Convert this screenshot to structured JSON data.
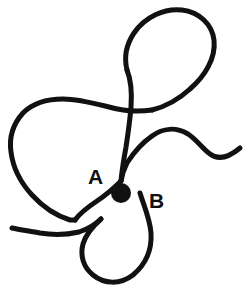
{
  "figure": {
    "type": "knot-curve-diagram",
    "width": 252,
    "height": 295,
    "background_color": "#ffffff",
    "stroke_color": "#111111",
    "stroke_width": 5
  },
  "labels": {
    "a": "A",
    "b": "B"
  },
  "points": [
    {
      "id": "A",
      "label": "A",
      "cx": 121,
      "cy": 181,
      "r": 10,
      "color": "#111111"
    },
    {
      "id": "B",
      "label": "B",
      "cx": 140,
      "cy": 193,
      "r": 10,
      "color": "#111111"
    }
  ],
  "label_positions": {
    "a": {
      "x": 88,
      "y": 184
    },
    "b": {
      "x": 149,
      "y": 208
    }
  },
  "paths": {
    "main_curve": "M 240 148 C 228 158 218 160 210 154 C 202 148 197 140 188 134 C 176 127 163 128 152 136 C 142 143 134 152 127 163 C 124 169 122 175 121 181",
    "lower_right_loop": "M 140 193 C 144 206 150 219 151 233 C 152 249 146 264 133 275 C 120 285 104 284 93 275 C 83 267 80 255 83 244 C 86 234 93 226 101 219",
    "left_sweep": "M 101 219 C 96 224 88 229 79 232 C 66 235 52 235 40 233 C 30 231 20 230 12 228",
    "a_to_lobe": "M 121 181 C 114 188 106 195 97 201 C 88 207 80 213 75 220",
    "descending_strand": "M 121 181 C 122 170 124 158 126 147 C 128 134 130 120 131 107 C 132 93 131 80 127 70",
    "teardrop": "M 127 70 C 124 58 126 45 134 33 C 145 17 164 8 182 10 C 199 12 212 24 214 40 C 216 58 205 76 190 89 C 178 100 164 107 152 110",
    "neck_to_left_lobe": "M 152 110 C 138 112 123 111 109 107 C 93 103 78 99 63 99 C 48 99 33 103 23 113 C 13 124 9 138 11 152 C 13 168 21 183 32 195 C 43 207 57 216 70 220 C 72 220 74 220 75 220"
  }
}
